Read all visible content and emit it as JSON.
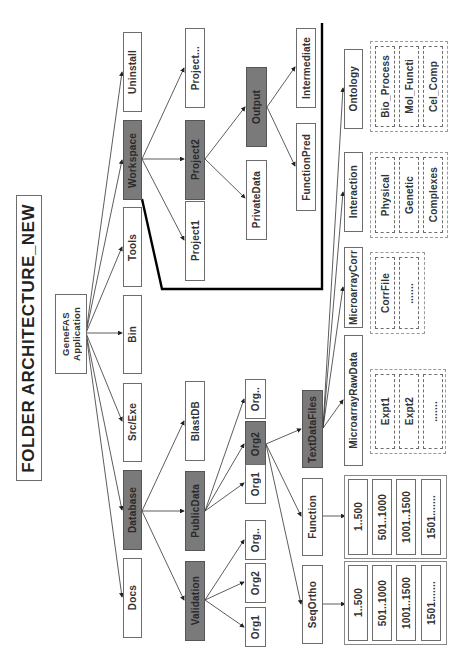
{
  "title": "FOLDER ARCHITECTURE_NEW",
  "root": "GeneFAS\nApplication",
  "level1": {
    "uninstall": "Uninstall",
    "workspace": "Workspace",
    "tools": "Tools",
    "bin": "Bin",
    "src_exe": "Src/Exe",
    "database": "Database",
    "docs": "Docs"
  },
  "workspace": {
    "project_more": "Project...",
    "project2": "Project2",
    "project1": "Project1",
    "output": "Output",
    "private_data": "PrivateData",
    "intermediate": "Intermediate",
    "function_pred": "FunctionPred"
  },
  "database": {
    "blastdb": "BlastDB",
    "public_data": "PublicData",
    "validation": "Validation",
    "public_orgs": [
      "Org..",
      "Org2",
      "Org1"
    ],
    "validation_orgs": [
      "Org..",
      "Org2",
      "Org1"
    ]
  },
  "org2": {
    "text_data_files": "TextDataFiles",
    "function": "Function",
    "seq_ortho": "SeqOrtho"
  },
  "text_data": {
    "ontology": "Ontology",
    "interaction": "Interaction",
    "microarray_corr": "MicroarrayCorr",
    "microarray_raw": "MicroarrayRawData",
    "ontology_items": [
      "Bio_Process",
      "Mol_Functi",
      "Cel_Comp"
    ],
    "interaction_items": [
      "Physical",
      "Genetic",
      "Complexes"
    ],
    "corr_items": [
      "CorrFile",
      "......."
    ],
    "raw_items": [
      "Expt1",
      "Expt2",
      "......."
    ]
  },
  "ranges": {
    "function_items": [
      "1..500",
      "501..1000",
      "1001..1500",
      "1501......."
    ],
    "seqortho_items": [
      "1..500",
      "501..1000",
      "1001..1500",
      "1501......."
    ]
  },
  "colors": {
    "dark_box": "#7a7a7a",
    "border": "#6d6d6d",
    "boundary_line": "#000000"
  }
}
